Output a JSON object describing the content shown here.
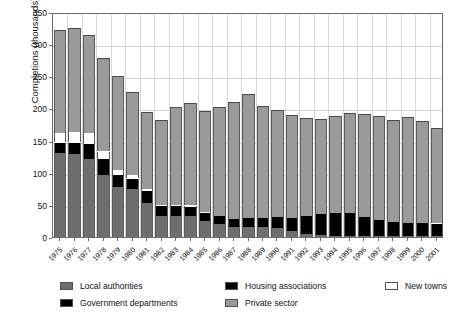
{
  "chart_data": {
    "type": "bar",
    "stacked": true,
    "title": "",
    "subtitle": "",
    "xlabel": "",
    "ylabel": "Completions (thousands)",
    "ylim": [
      0,
      350
    ],
    "yticks": [
      0,
      50,
      100,
      150,
      200,
      250,
      300,
      350
    ],
    "grid": true,
    "legend_position": "bottom",
    "categories": [
      "1975",
      "1976",
      "1977",
      "1978",
      "1979",
      "1980",
      "1981",
      "1982",
      "1983",
      "1984",
      "1985",
      "1986",
      "1987",
      "1988",
      "1989",
      "1990",
      "1991",
      "1992",
      "1993",
      "1994",
      "1995",
      "1996",
      "1997",
      "1998",
      "1999",
      "2000",
      "2001"
    ],
    "series": [
      {
        "name": "Local authorities",
        "color": "#6e6e6e",
        "values": [
          130,
          129,
          122,
          97,
          78,
          75,
          53,
          33,
          33,
          32,
          25,
          20,
          16,
          16,
          15,
          14,
          9,
          4,
          3,
          2,
          2,
          1,
          1,
          1,
          1,
          1,
          1
        ]
      },
      {
        "name": "Government departments",
        "color": "#000000",
        "values": [
          0,
          0,
          0,
          0,
          0,
          0,
          0,
          0,
          0,
          0,
          0,
          0,
          0,
          0,
          0,
          0,
          0,
          0,
          0,
          0,
          0,
          0,
          0,
          0,
          0,
          0,
          0
        ]
      },
      {
        "name": "Housing associations",
        "color": "#000000",
        "values": [
          17,
          18,
          22,
          24,
          18,
          16,
          18,
          15,
          16,
          16,
          13,
          12,
          12,
          13,
          14,
          17,
          20,
          28,
          33,
          36,
          36,
          30,
          26,
          22,
          21,
          21,
          20
        ]
      },
      {
        "name": "New towns",
        "color": "#ffffff",
        "values": [
          15,
          16,
          18,
          12,
          8,
          6,
          4,
          2,
          1,
          1,
          1,
          0,
          0,
          0,
          0,
          0,
          0,
          0,
          0,
          0,
          0,
          0,
          0,
          0,
          0,
          0,
          0
        ]
      },
      {
        "name": "Private sector",
        "color": "#9a9a9a",
        "values": [
          160,
          162,
          152,
          146,
          147,
          128,
          119,
          132,
          152,
          159,
          157,
          170,
          182,
          193,
          175,
          166,
          161,
          153,
          148,
          150,
          155,
          160,
          162,
          159,
          165,
          159,
          148
        ]
      }
    ],
    "totals": [
      322,
      325,
      314,
      279,
      251,
      225,
      194,
      182,
      202,
      208,
      196,
      202,
      210,
      222,
      204,
      197,
      190,
      185,
      184,
      188,
      193,
      191,
      189,
      182,
      187,
      181,
      169
    ]
  },
  "legend": {
    "items": [
      {
        "label": "Local authorities",
        "swatch": "#6e6e6e"
      },
      {
        "label": "Housing associations",
        "swatch": "#000000"
      },
      {
        "label": "New towns",
        "swatch": "#ffffff"
      },
      {
        "label": "Government departments",
        "swatch": "#000000"
      },
      {
        "label": "Private sector",
        "swatch": "#9a9a9a"
      }
    ]
  }
}
